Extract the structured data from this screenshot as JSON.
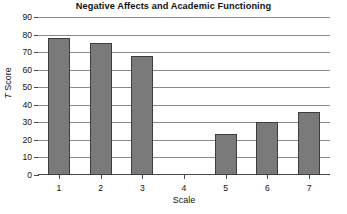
{
  "chart_data": {
    "type": "bar",
    "title": "Negative Affects and Academic Functioning",
    "xlabel": "Scale",
    "ylabel": "T Score",
    "categories": [
      "1",
      "2",
      "3",
      "4",
      "5",
      "6",
      "7"
    ],
    "values": [
      78,
      75,
      68,
      0,
      23.5,
      30,
      36
    ],
    "ylim": [
      0,
      90
    ],
    "ytick_step": 10,
    "yticks": [
      0,
      10,
      20,
      30,
      40,
      50,
      60,
      70,
      80,
      90
    ],
    "ytick_labels": [
      "0",
      "10",
      "20",
      "30",
      "40",
      "50",
      "60",
      "70",
      "80",
      "90"
    ],
    "grid": true,
    "grid_axis": "y",
    "legend": false,
    "legend_position": "none",
    "bar_color": "#7a7a7a",
    "bar_border_color": "#3d3d3d",
    "gridline_color": "#8a8a8a",
    "axis_color": "#4a4a4a",
    "background_color": "#ffffff"
  },
  "axis": {
    "y_title_italic_prefix": "T",
    "y_title_rest": " Score"
  }
}
